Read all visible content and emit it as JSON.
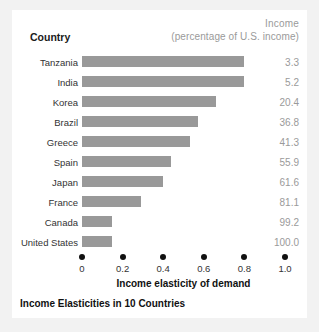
{
  "figure": {
    "caption": "Income Elasticities in 10 Countries",
    "header": {
      "country_label": "Country",
      "income_label": "Income",
      "income_sublabel": "(percentage of U.S. income)"
    },
    "colors": {
      "bar": "#999999",
      "panel_background": "#ffffff",
      "outer_background": "#f2f2f2",
      "value_text": "#9a9a9a",
      "label_text": "#333333",
      "tick": "#111111"
    }
  },
  "chart_data": {
    "type": "bar",
    "orientation": "horizontal",
    "title": "Income Elasticities in 10 Countries",
    "xlabel": "Income elasticity of demand",
    "ylabel": "Country",
    "xlim": [
      0,
      1.0
    ],
    "xticks": [
      0,
      0.2,
      0.4,
      0.6,
      0.8,
      1.0
    ],
    "xtick_labels": [
      "0",
      "0.2",
      "0.4",
      "0.6",
      "0.8",
      "1.0"
    ],
    "grid": false,
    "legend": "none",
    "categories": [
      "Tanzania",
      "India",
      "Korea",
      "Brazil",
      "Greece",
      "Spain",
      "Japan",
      "France",
      "Canada",
      "United States"
    ],
    "values": [
      0.8,
      0.8,
      0.66,
      0.57,
      0.53,
      0.44,
      0.4,
      0.29,
      0.15,
      0.15
    ],
    "annotations": {
      "column_header": "Income (percentage of U.S. income)",
      "income_percent_of_us": [
        "3.3",
        "5.2",
        "20.4",
        "36.8",
        "41.3",
        "55.9",
        "61.6",
        "81.1",
        "99.2",
        "100.0"
      ]
    },
    "rows": [
      {
        "country": "Tanzania",
        "elasticity": 0.8,
        "income": "3.3"
      },
      {
        "country": "India",
        "elasticity": 0.8,
        "income": "5.2"
      },
      {
        "country": "Korea",
        "elasticity": 0.66,
        "income": "20.4"
      },
      {
        "country": "Brazil",
        "elasticity": 0.57,
        "income": "36.8"
      },
      {
        "country": "Greece",
        "elasticity": 0.53,
        "income": "41.3"
      },
      {
        "country": "Spain",
        "elasticity": 0.44,
        "income": "55.9"
      },
      {
        "country": "Japan",
        "elasticity": 0.4,
        "income": "61.6"
      },
      {
        "country": "France",
        "elasticity": 0.29,
        "income": "81.1"
      },
      {
        "country": "Canada",
        "elasticity": 0.15,
        "income": "99.2"
      },
      {
        "country": "United States",
        "elasticity": 0.15,
        "income": "100.0"
      }
    ]
  }
}
